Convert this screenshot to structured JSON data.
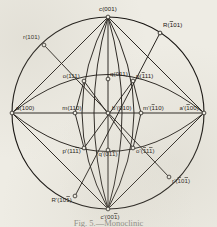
{
  "figure": {
    "caption": "Fig. 5.—Monoclinic",
    "circle": {
      "cx": 108,
      "cy": 113,
      "r": 96
    },
    "ink_color": "#14110e",
    "paper_color": "#eeece4"
  },
  "poles": [
    {
      "id": "c",
      "label_main": "c",
      "index": "001",
      "bars": [],
      "x": 108,
      "y": 17,
      "lx": 108,
      "ly": 11,
      "anchor": "middle"
    },
    {
      "id": "c-prime",
      "label_main": "c'",
      "index": "001",
      "bars": [
        2
      ],
      "x": 108,
      "y": 209,
      "lx": 110,
      "ly": 219,
      "anchor": "middle"
    },
    {
      "id": "a",
      "label_main": "a",
      "index": "100",
      "bars": [],
      "x": 12,
      "y": 113,
      "lx": 16,
      "ly": 110,
      "anchor": "start"
    },
    {
      "id": "a-prime",
      "label_main": "a'",
      "index": "100",
      "bars": [
        0
      ],
      "x": 204,
      "y": 113,
      "lx": 199,
      "ly": 110,
      "anchor": "end"
    },
    {
      "id": "b-prime",
      "label_main": "b'",
      "index": "010",
      "bars": [],
      "x": 108,
      "y": 113,
      "lx": 112,
      "ly": 110,
      "anchor": "start"
    },
    {
      "id": "m",
      "label_main": "m",
      "index": "110",
      "bars": [],
      "x": 75,
      "y": 113,
      "lx": 72,
      "ly": 110,
      "anchor": "middle"
    },
    {
      "id": "m-prime",
      "label_main": "m'",
      "index": "110",
      "bars": [
        0
      ],
      "x": 141,
      "y": 113,
      "lx": 143,
      "ly": 110,
      "anchor": "start"
    },
    {
      "id": "o",
      "label_main": "o",
      "index": "111",
      "bars": [],
      "x": 84,
      "y": 81,
      "lx": 80,
      "ly": 78,
      "anchor": "end"
    },
    {
      "id": "q",
      "label_main": "q",
      "index": "011",
      "bars": [],
      "x": 108,
      "y": 79,
      "lx": 110,
      "ly": 76,
      "anchor": "start"
    },
    {
      "id": "p",
      "label_main": "p",
      "index": "111",
      "bars": [
        0
      ],
      "x": 133,
      "y": 81,
      "lx": 136,
      "ly": 78,
      "anchor": "start"
    },
    {
      "id": "p-prime",
      "label_main": "p'",
      "index": "111",
      "bars": [
        2
      ],
      "x": 84,
      "y": 148,
      "lx": 81,
      "ly": 153,
      "anchor": "end"
    },
    {
      "id": "q-prime",
      "label_main": "q'",
      "index": "011",
      "bars": [
        2
      ],
      "x": 108,
      "y": 150,
      "lx": 108,
      "ly": 156,
      "anchor": "middle"
    },
    {
      "id": "o-prime",
      "label_main": "o'",
      "index": "111",
      "bars": [
        0,
        2
      ],
      "x": 133,
      "y": 148,
      "lx": 136,
      "ly": 153,
      "anchor": "start"
    },
    {
      "id": "r",
      "label_main": "r",
      "index": "101",
      "bars": [],
      "x": 44,
      "y": 45,
      "lx": 40,
      "ly": 39,
      "anchor": "end"
    },
    {
      "id": "R",
      "label_main": "R",
      "index": "101",
      "bars": [
        0
      ],
      "x": 160,
      "y": 33,
      "lx": 163,
      "ly": 27,
      "anchor": "start"
    },
    {
      "id": "R-prime",
      "label_main": "R'",
      "index": "101",
      "bars": [
        2
      ],
      "x": 75,
      "y": 196,
      "lx": 72,
      "ly": 202,
      "anchor": "end"
    },
    {
      "id": "r-prime",
      "label_main": "r'",
      "index": "101",
      "bars": [
        0,
        2
      ],
      "x": 169,
      "y": 177,
      "lx": 172,
      "ly": 183,
      "anchor": "start"
    }
  ],
  "great_circles": [
    {
      "name": "primitive-circle",
      "kind": "circle"
    },
    {
      "name": "equator-line",
      "kind": "line"
    },
    {
      "name": "vertical-meridian",
      "kind": "line"
    },
    {
      "name": "upper-lens-arc",
      "kind": "arc"
    },
    {
      "name": "lower-lens-arc",
      "kind": "arc"
    },
    {
      "name": "meridian-left",
      "kind": "arc"
    },
    {
      "name": "meridian-right",
      "kind": "arc"
    },
    {
      "name": "zone-r-Rprime",
      "kind": "line"
    },
    {
      "name": "zone-R-rprime",
      "kind": "line"
    }
  ]
}
